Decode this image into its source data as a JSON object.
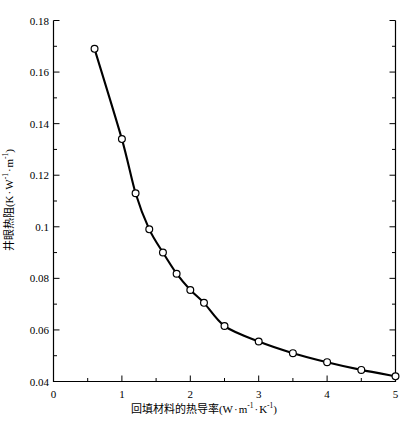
{
  "chart_data": {
    "type": "line",
    "title": "",
    "xlabel_parts": {
      "text": "回填材料的热导率(W",
      "unit_mid": "m",
      "unit_mid_sup": "-1",
      "unit_end": "K",
      "unit_end_sup": "-1",
      "close": ")"
    },
    "ylabel_parts": {
      "text": "井眼热阻(K",
      "unit_mid": "W",
      "unit_mid_sup": "-1",
      "unit_end": "m",
      "unit_end_sup": "-1",
      "close": ")"
    },
    "xlabel": "回填材料的热导率(W · m-1 · K-1)",
    "ylabel": "井眼热阻(K · W-1 · m-1)",
    "xlim": [
      0,
      5
    ],
    "ylim": [
      0.04,
      0.18
    ],
    "grid": false,
    "legend": false,
    "x_major_ticks": [
      0,
      1,
      2,
      3,
      4,
      5
    ],
    "x_major_tick_labels": [
      "0",
      "1",
      "2",
      "3",
      "4",
      "5"
    ],
    "x_minor_ticks": [
      0.5,
      1.5,
      2.5,
      3.5,
      4.5
    ],
    "y_major_ticks": [
      0.04,
      0.06,
      0.08,
      0.1,
      0.12,
      0.14,
      0.16,
      0.18
    ],
    "y_major_tick_labels": [
      "0.04",
      "0.06",
      "0.08",
      "0.1",
      "0.12",
      "0.14",
      "0.16",
      "0.18"
    ],
    "y_minor_ticks": [
      0.05,
      0.07,
      0.09,
      0.11,
      0.13,
      0.15,
      0.17
    ],
    "marker": "open-circle",
    "line_color": "#000000",
    "marker_face_color": "#ffffff",
    "x": [
      0.6,
      1.0,
      1.2,
      1.4,
      1.6,
      1.8,
      2.0,
      2.2,
      2.5,
      3.0,
      3.5,
      4.0,
      4.5,
      5.0
    ],
    "values": [
      0.169,
      0.134,
      0.113,
      0.099,
      0.09,
      0.0818,
      0.0755,
      0.0705,
      0.0615,
      0.0555,
      0.051,
      0.0475,
      0.0445,
      0.042
    ],
    "series": [
      {
        "name": "井眼热阻",
        "x": [
          0.6,
          1.0,
          1.2,
          1.4,
          1.6,
          1.8,
          2.0,
          2.2,
          2.5,
          3.0,
          3.5,
          4.0,
          4.5,
          5.0
        ],
        "values": [
          0.169,
          0.134,
          0.113,
          0.099,
          0.09,
          0.0818,
          0.0755,
          0.0705,
          0.0615,
          0.0555,
          0.051,
          0.0475,
          0.0445,
          0.042
        ]
      }
    ]
  }
}
